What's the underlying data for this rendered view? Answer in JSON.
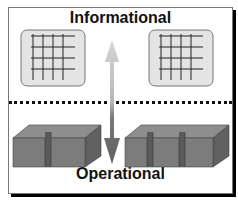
{
  "diagram": {
    "top_label": "Informational",
    "bottom_label": "Operational",
    "top_left_icon": "grid-table-icon",
    "top_right_icon": "grid-table-icon",
    "bottom_left_icon": "block-one-slot-icon",
    "bottom_right_icon": "block-two-slots-icon",
    "arrow": "bidirectional-vertical-arrow",
    "colors": {
      "arrow_up": "#c8c8c8",
      "arrow_down": "#6a6a6a",
      "panel_fill": "#e4e4e4",
      "block_fill": "#7a7a7a"
    }
  }
}
